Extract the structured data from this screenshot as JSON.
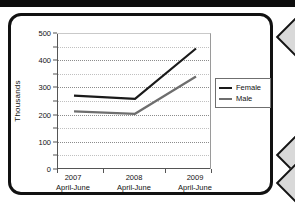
{
  "figure": {
    "frame_style": "rounded-black-border"
  },
  "chart_data": {
    "type": "line",
    "title": "",
    "xlabel": "",
    "ylabel": "Thousands",
    "ylim": [
      0,
      500
    ],
    "ytick_labels": [
      "0",
      "100",
      "200",
      "300",
      "400",
      "500"
    ],
    "ytick_values": [
      0,
      100,
      200,
      300,
      400,
      500
    ],
    "minor_gridline_values": [
      50,
      150,
      250,
      350,
      450
    ],
    "grid": true,
    "legend_position": "right",
    "categories": [
      "2007 April-June",
      "2008 April-June",
      "2009 April-June"
    ],
    "category_lines": [
      [
        "2007",
        "April-June"
      ],
      [
        "2008",
        "April-June"
      ],
      [
        "2009",
        "April-June"
      ]
    ],
    "series": [
      {
        "name": "Female",
        "values": [
          270,
          258,
          443
        ],
        "color": "#1a1a1a"
      },
      {
        "name": "Male",
        "values": [
          212,
          203,
          340
        ],
        "color": "#6e6e6e"
      }
    ]
  },
  "legend": {
    "items": [
      {
        "label": "Female"
      },
      {
        "label": "Male"
      }
    ]
  },
  "colors": {
    "female_line": "#1a1a1a",
    "male_line": "#6e6e6e",
    "axis": "#555555",
    "grid": "#8c8c8c",
    "frame": "#111111"
  }
}
